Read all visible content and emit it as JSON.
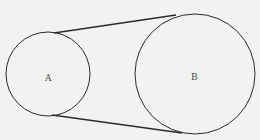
{
  "diagram": {
    "type": "belt-pulley",
    "background": "#f2f2f0",
    "stroke_color": "#2a2a2a",
    "circles": [
      {
        "label": "A",
        "cx": 48,
        "cy": 73,
        "r": 42
      },
      {
        "label": "B",
        "cx": 194,
        "cy": 74,
        "r": 60
      }
    ],
    "tangents": [
      {
        "name": "top",
        "x1": 54,
        "y1": 33,
        "x2": 176,
        "y2": 15
      },
      {
        "name": "bottom",
        "x1": 52,
        "y1": 115,
        "x2": 182,
        "y2": 133
      }
    ]
  }
}
